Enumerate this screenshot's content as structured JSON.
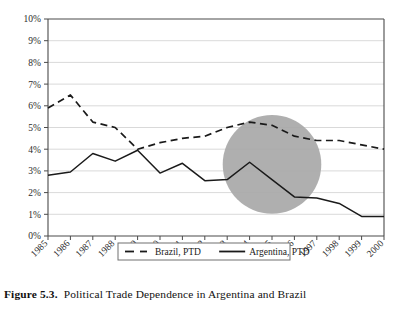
{
  "caption": {
    "figure_number": "Figure 5.3.",
    "text": "Political Trade Dependence in Argentina and Brazil"
  },
  "legend": {
    "items": [
      {
        "label": "Brazil, PTD",
        "style": "dashed",
        "color": "#1a1a1a"
      },
      {
        "label": "Argentina, PTD",
        "style": "solid",
        "color": "#1a1a1a"
      }
    ]
  },
  "annotation": {
    "highlight_shape": "circle",
    "highlight_color": "#a8a8a8",
    "highlight_center_year": 1995,
    "highlight_center_value": 3.3,
    "highlight_radius_years": 2.2
  },
  "chart_data": {
    "type": "line",
    "title": "",
    "xlabel": "",
    "ylabel": "",
    "x": [
      1985,
      1986,
      1987,
      1988,
      1989,
      1990,
      1991,
      1992,
      1993,
      1994,
      1995,
      1996,
      1997,
      1998,
      1999,
      2000
    ],
    "categories": [
      "1985",
      "1986",
      "1987",
      "1988",
      "1989",
      "1990",
      "1991",
      "1992",
      "1993",
      "1994",
      "1995",
      "1996",
      "1997",
      "1998",
      "1999",
      "2000"
    ],
    "series": [
      {
        "name": "Brazil, PTD",
        "style": "dashed",
        "values": [
          5.9,
          6.5,
          5.25,
          5.0,
          4.0,
          4.3,
          4.5,
          4.6,
          5.0,
          5.25,
          5.1,
          4.6,
          4.4,
          4.4,
          4.2,
          4.0
        ]
      },
      {
        "name": "Argentina, PTD",
        "style": "solid",
        "values": [
          2.8,
          2.95,
          3.8,
          3.45,
          3.95,
          2.9,
          3.35,
          2.55,
          2.6,
          3.4,
          2.6,
          1.8,
          1.75,
          1.5,
          0.9,
          0.9
        ]
      }
    ],
    "ylim": [
      0,
      10
    ],
    "ytick_labels": [
      "0%",
      "1%",
      "2%",
      "3%",
      "4%",
      "5%",
      "6%",
      "7%",
      "8%",
      "9%",
      "10%"
    ],
    "ytick_values": [
      0,
      1,
      2,
      3,
      4,
      5,
      6,
      7,
      8,
      9,
      10
    ],
    "xlim": [
      1985,
      2000
    ],
    "grid": true,
    "legend_position": "bottom"
  }
}
